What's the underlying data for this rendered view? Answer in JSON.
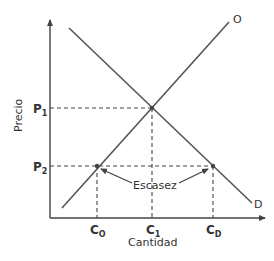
{
  "diagram": {
    "y_axis_label": "Precio",
    "x_axis_label": "Cantidad",
    "supply_label": "O",
    "demand_label": "D",
    "price_ticks": [
      {
        "main": "P",
        "sub": "1"
      },
      {
        "main": "P",
        "sub": "2"
      }
    ],
    "quantity_ticks": [
      {
        "main": "C",
        "sub": "O"
      },
      {
        "main": "C",
        "sub": "1"
      },
      {
        "main": "C",
        "sub": "D"
      }
    ],
    "annotation": "Escasez",
    "colors": {
      "line": "#555555",
      "text": "#333333",
      "background": "#ffffff"
    }
  }
}
